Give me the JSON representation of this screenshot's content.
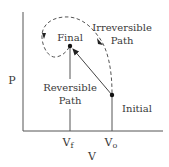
{
  "diagram": {
    "axes": {
      "y_label": "P",
      "x_label": "V",
      "x_ticks": [
        {
          "main": "V",
          "sub": "f"
        },
        {
          "main": "V",
          "sub": "o"
        }
      ]
    },
    "points": {
      "final": {
        "label": "Final"
      },
      "initial": {
        "label": "Initial"
      }
    },
    "paths": {
      "reversible": {
        "line1": "Reversible",
        "line2": "Path"
      },
      "irreversible": {
        "line1": "Irreversible",
        "line2": "Path"
      }
    },
    "colors": {
      "axis": "#555555",
      "line": "#444444",
      "dashed": "#555555",
      "point": "#111111",
      "text": "#3a3a3a"
    }
  }
}
